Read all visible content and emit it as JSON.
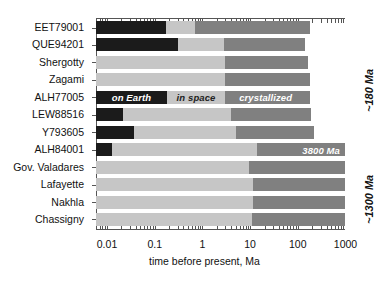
{
  "chart_data": {
    "type": "bar",
    "orientation": "horizontal",
    "stacked": true,
    "scale": "log",
    "title": "",
    "xlabel": "time before present, Ma",
    "ylabel": "",
    "xlim": [
      0.0044,
      5500
    ],
    "xticks": [
      0.01,
      0.1,
      1,
      10,
      100,
      1000
    ],
    "xticklabels": [
      "0.01",
      "0.1",
      "1",
      "10",
      "100",
      "1000"
    ],
    "grid": false,
    "legend_position": "inline-on-bar",
    "series": [
      {
        "name": "on Earth",
        "color": "#1b1b1b",
        "label_color": "#ffffff"
      },
      {
        "name": "in space",
        "color": "#c6c6c6",
        "label_color": "#222222"
      },
      {
        "name": "crystallized",
        "color": "#808080",
        "label_color": "#ffffff"
      }
    ],
    "categories": [
      "EET79001",
      "QUE94201",
      "Shergotty",
      "Zagami",
      "ALH77005",
      "LEW88516",
      "Y793605",
      "ALH84001",
      "Gov. Valadares",
      "Lafayette",
      "Nakhla",
      "Chassigny"
    ],
    "rows": [
      {
        "name": "EET79001",
        "on_earth_end": 0.17,
        "in_space_end": 0.7,
        "crystallized_end": 180
      },
      {
        "name": "QUE94201",
        "on_earth_end": 0.3,
        "in_space_end": 2.8,
        "crystallized_end": 140
      },
      {
        "name": "Shergotty",
        "on_earth_end": 0.0,
        "in_space_end": 2.9,
        "crystallized_end": 165
      },
      {
        "name": "Zagami",
        "on_earth_end": 0.0,
        "in_space_end": 2.9,
        "crystallized_end": 180
      },
      {
        "name": "ALH77005",
        "on_earth_end": 0.18,
        "in_space_end": 3.0,
        "crystallized_end": 180
      },
      {
        "name": "LEW88516",
        "on_earth_end": 0.022,
        "in_space_end": 4.0,
        "crystallized_end": 190
      },
      {
        "name": "Y793605",
        "on_earth_end": 0.036,
        "in_space_end": 5.0,
        "crystallized_end": 220
      },
      {
        "name": "ALH84001",
        "on_earth_end": 0.013,
        "in_space_end": 14.0,
        "crystallized_end": 3800
      },
      {
        "name": "Gov. Valadares",
        "on_earth_end": 0.0,
        "in_space_end": 9.5,
        "crystallized_end": 1300
      },
      {
        "name": "Lafayette",
        "on_earth_end": 0.0,
        "in_space_end": 11.5,
        "crystallized_end": 1300
      },
      {
        "name": "Nakhla",
        "on_earth_end": 0.0,
        "in_space_end": 11.5,
        "crystallized_end": 1300
      },
      {
        "name": "Chassigny",
        "on_earth_end": 0.0,
        "in_space_end": 11.0,
        "crystallized_end": 1300
      }
    ],
    "inline_labels": {
      "row": "ALH77005",
      "on_earth": "on Earth",
      "in_space": "in space",
      "crystallized": "crystallized"
    },
    "data_labels": [
      {
        "row": "ALH84001",
        "text": "3800 Ma"
      }
    ],
    "annotations": [
      {
        "text": "~180 Ma",
        "rows": "EET79001 through Y793605",
        "rotation": -90
      },
      {
        "text": "~1300 Ma",
        "rows": "Gov. Valadares through Chassigny",
        "rotation": -90
      }
    ]
  }
}
